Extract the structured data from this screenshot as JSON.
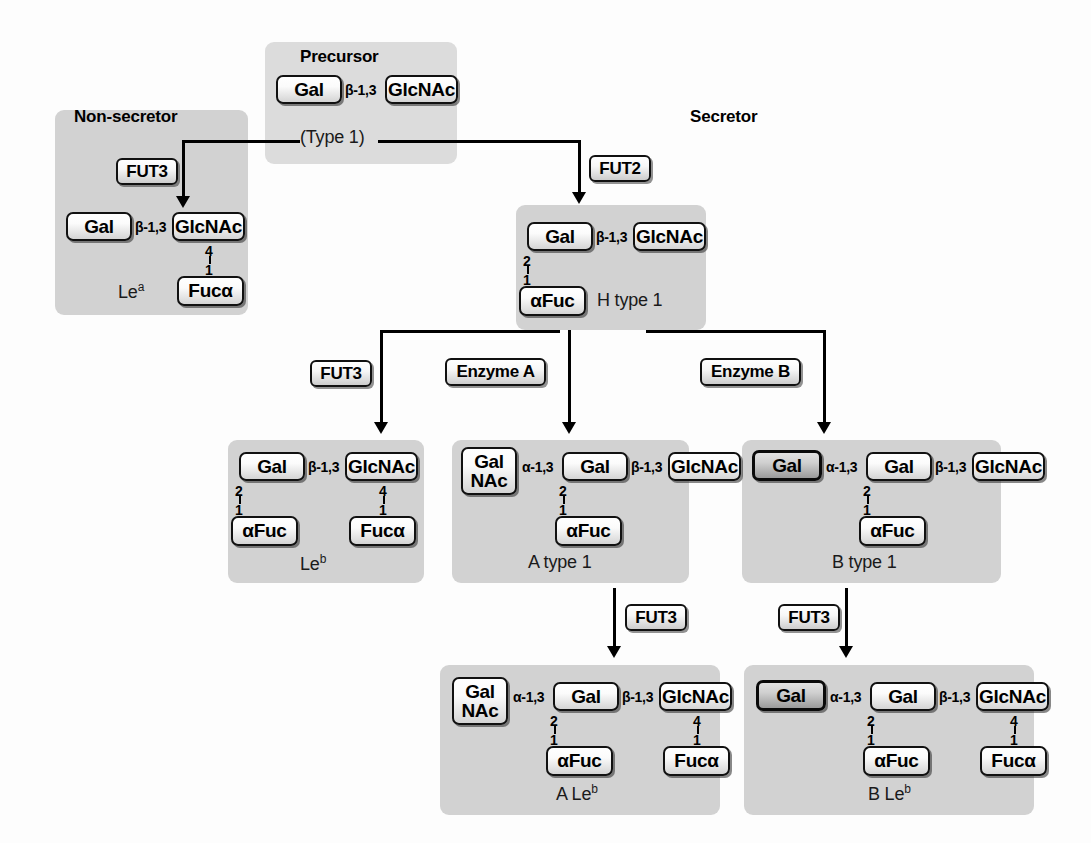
{
  "diagram": {
    "sections": {
      "non_secretor": "Non-secretor",
      "secretor": "Secretor",
      "precursor": "Precursor"
    },
    "colors": {
      "panel": "#d2d2d2",
      "panel_light": "#dcdcdc",
      "box_border": "#111111",
      "text": "#000000",
      "background": "#fdfdfd"
    }
  },
  "residues": {
    "gal": "Gal",
    "glcnac": "GlcNAc",
    "fuc_pre_alpha": "αFuc",
    "fuc_post_alpha": "Fucα",
    "galnac_line1": "Gal",
    "galnac_line2": "NAc"
  },
  "linkages": {
    "beta13": "β-1,3",
    "alpha13": "α-1,3"
  },
  "numerals": {
    "two": "2",
    "one": "1",
    "four": "4"
  },
  "enzymes": {
    "fut2": "FUT2",
    "fut3": "FUT3",
    "enzyme_a": "Enzyme A",
    "enzyme_b": "Enzyme B"
  },
  "captions": {
    "type1": "(Type 1)",
    "le_a": "Le",
    "le_a_sup": "a",
    "h_type1": "H type 1",
    "le_b": "Le",
    "le_b_sup": "b",
    "a_type1": "A type 1",
    "b_type1": "B type 1",
    "a_le_b": "A Le",
    "a_le_b_sup": "b",
    "b_le_b": "B Le",
    "b_le_b_sup": "b"
  }
}
